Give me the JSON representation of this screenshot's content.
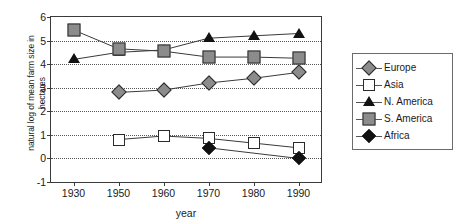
{
  "chart_data": {
    "type": "line",
    "title": "",
    "xlabel": "year",
    "ylabel": "natural log of mean farm size in\nhectares",
    "categories": [
      "1930",
      "1950",
      "1960",
      "1970",
      "1980",
      "1990"
    ],
    "ylim": [
      -1,
      6
    ],
    "yticks": [
      "-1",
      "0",
      "1",
      "2",
      "3",
      "4",
      "5",
      "6"
    ],
    "grid": true,
    "legend_position": "right",
    "series": [
      {
        "name": "Europe",
        "marker": "diamond-gray",
        "color": "#8c8c8c",
        "x": [
          "1950",
          "1960",
          "1970",
          "1980",
          "1990"
        ],
        "values": [
          2.8,
          2.9,
          3.2,
          3.4,
          3.65
        ]
      },
      {
        "name": "Asia",
        "marker": "square-white",
        "color": "#ffffff",
        "x": [
          "1950",
          "1960",
          "1970",
          "1980",
          "1990"
        ],
        "values": [
          0.8,
          0.95,
          0.85,
          0.65,
          0.45
        ]
      },
      {
        "name": "N. America",
        "marker": "triangle-black",
        "color": "#121212",
        "x": [
          "1930",
          "1950",
          "1960",
          "1970",
          "1980",
          "1990"
        ],
        "values": [
          4.2,
          4.5,
          4.6,
          5.1,
          5.2,
          5.3
        ]
      },
      {
        "name": "S. America",
        "marker": "square-gray",
        "color": "#8c8c8c",
        "x": [
          "1930",
          "1950",
          "1960",
          "1970",
          "1980",
          "1990"
        ],
        "values": [
          5.45,
          4.65,
          4.55,
          4.3,
          4.3,
          4.25
        ]
      },
      {
        "name": "Africa",
        "marker": "diamond-black",
        "color": "#121212",
        "x": [
          "1970",
          "1990"
        ],
        "values": [
          0.45,
          0.0
        ]
      }
    ]
  },
  "legend": {
    "items": [
      {
        "label": "Europe"
      },
      {
        "label": "Asia"
      },
      {
        "label": "N. America"
      },
      {
        "label": "S. America"
      },
      {
        "label": "Africa"
      }
    ]
  }
}
